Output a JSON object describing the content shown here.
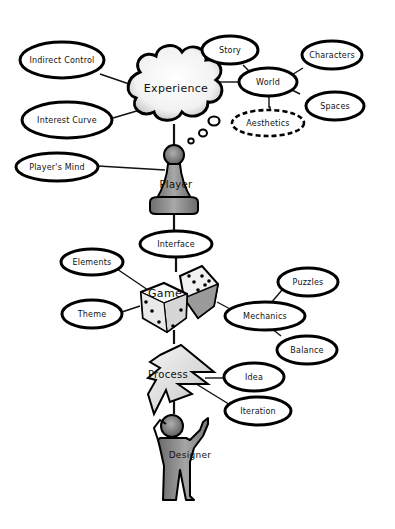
{
  "diagram": {
    "type": "mind-map",
    "hubs": {
      "experience": "Experience",
      "player": "Player",
      "game": "Game",
      "process": "Process",
      "designer": "Designer"
    },
    "nodes": {
      "indirect_control": "Indirect Control",
      "interest_curve": "Interest Curve",
      "story": "Story",
      "world": "World",
      "characters": "Characters",
      "spaces": "Spaces",
      "aesthetics": "Aesthetics",
      "players_mind": "Player's Mind",
      "interface": "Interface",
      "elements": "Elements",
      "theme": "Theme",
      "mechanics": "Mechanics",
      "puzzles": "Puzzles",
      "balance": "Balance",
      "idea": "Idea",
      "iteration": "Iteration"
    },
    "connections": [
      [
        "Experience",
        "Indirect Control"
      ],
      [
        "Experience",
        "Interest Curve"
      ],
      [
        "Experience",
        "World"
      ],
      [
        "World",
        "Story"
      ],
      [
        "World",
        "Characters"
      ],
      [
        "World",
        "Spaces"
      ],
      [
        "World",
        "Aesthetics"
      ],
      [
        "Experience",
        "Player"
      ],
      [
        "Player",
        "Player's Mind"
      ],
      [
        "Player",
        "Interface"
      ],
      [
        "Interface",
        "Game"
      ],
      [
        "Game",
        "Elements"
      ],
      [
        "Game",
        "Theme"
      ],
      [
        "Game",
        "Mechanics"
      ],
      [
        "Mechanics",
        "Puzzles"
      ],
      [
        "Mechanics",
        "Balance"
      ],
      [
        "Game",
        "Process"
      ],
      [
        "Process",
        "Idea"
      ],
      [
        "Process",
        "Iteration"
      ],
      [
        "Process",
        "Designer"
      ]
    ],
    "colors": {
      "stroke": "#000000",
      "fill": "#ffffff",
      "figure_gray": "#8a8a8a"
    }
  }
}
